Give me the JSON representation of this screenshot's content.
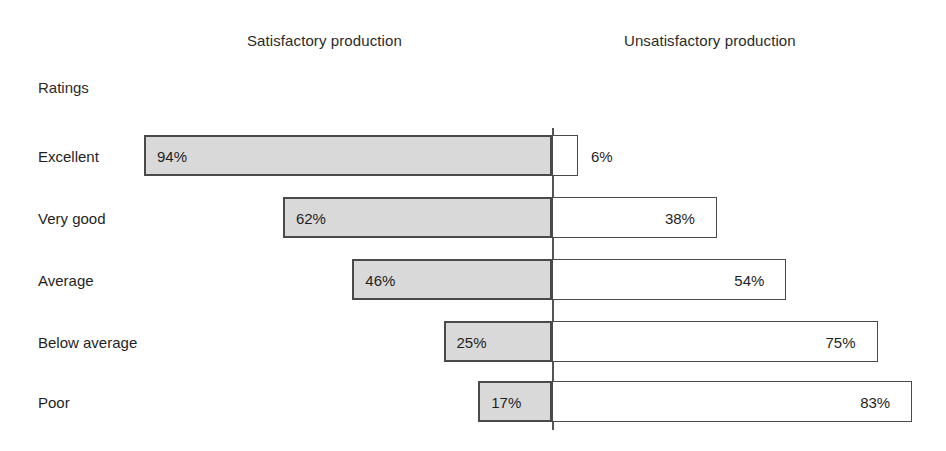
{
  "header": {
    "left_title": "Satisfactory production",
    "right_title": "Unsatisfactory production"
  },
  "axis": {
    "category_caption": "Ratings"
  },
  "style": {
    "left_bar_fill": "#d9d9d9",
    "right_bar_fill": "#ffffff",
    "bar_border": "#4a4a4a",
    "divider_color": "#555555",
    "background": "#ffffff",
    "text_color": "#1f1f1f"
  },
  "chart_data": {
    "type": "bar",
    "title": "",
    "subtitle": "",
    "orientation": "horizontal",
    "layout": "diverging-stacked",
    "xlabel": "",
    "ylabel": "Ratings",
    "grid": false,
    "legend_position": "top",
    "xlim": [
      0,
      100
    ],
    "center_baseline": 0,
    "categories": [
      "Excellent",
      "Very good",
      "Average",
      "Below average",
      "Poor"
    ],
    "series": [
      {
        "name": "Satisfactory production",
        "side": "left",
        "values": [
          94,
          62,
          46,
          25,
          17
        ],
        "labels": [
          "94%",
          "62%",
          "46%",
          "25%",
          "17%"
        ]
      },
      {
        "name": "Unsatisfactory production",
        "side": "right",
        "values": [
          6,
          38,
          54,
          75,
          83
        ],
        "labels": [
          "6%",
          "38%",
          "54%",
          "75%",
          "83%"
        ]
      }
    ],
    "rows": [
      {
        "category": "Excellent",
        "left_value": 94,
        "left_label": "94%",
        "right_value": 6,
        "right_label": "6%"
      },
      {
        "category": "Very good",
        "left_value": 62,
        "left_label": "62%",
        "right_value": 38,
        "right_label": "38%"
      },
      {
        "category": "Average",
        "left_value": 46,
        "left_label": "46%",
        "right_value": 54,
        "right_label": "54%"
      },
      {
        "category": "Below average",
        "left_value": 25,
        "left_label": "25%",
        "right_value": 75,
        "right_label": "75%"
      },
      {
        "category": "Poor",
        "left_value": 17,
        "left_label": "17%",
        "right_value": 83,
        "right_label": "83%"
      }
    ]
  },
  "geometry": {
    "center_x": 552,
    "px_per_percent": 4.34,
    "bar_height": 41,
    "row_tops": [
      135,
      197,
      259,
      321,
      381
    ],
    "divider_top": 128,
    "divider_bottom": 430
  }
}
